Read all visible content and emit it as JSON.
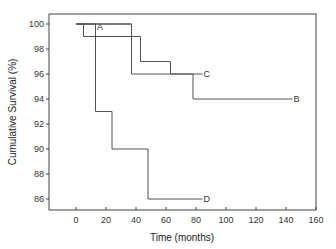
{
  "chart_data": {
    "type": "line",
    "subtype": "step (Kaplan-Meier)",
    "title": "",
    "xlabel": "Time (months)",
    "ylabel": "Cumulative Survival (%)",
    "xlim": [
      -15,
      160
    ],
    "ylim": [
      85.3,
      101.2
    ],
    "x_ticks": [
      0,
      20,
      40,
      60,
      80,
      100,
      120,
      140,
      160
    ],
    "y_ticks": [
      86,
      88,
      90,
      92,
      94,
      96,
      98,
      100
    ],
    "grid": false,
    "legend": "inline labels at curve ends",
    "series": [
      {
        "name": "A",
        "label_at": [
          12,
          100
        ],
        "steps": [
          [
            0,
            100
          ],
          [
            37,
            100
          ]
        ]
      },
      {
        "name": "B",
        "label_at": [
          145,
          94
        ],
        "steps": [
          [
            0,
            100
          ],
          [
            37,
            100
          ],
          [
            37,
            96
          ],
          [
            78,
            96
          ],
          [
            78,
            94
          ],
          [
            142,
            94
          ]
        ]
      },
      {
        "name": "C",
        "label_at": [
          85,
          96
        ],
        "steps": [
          [
            0,
            100
          ],
          [
            5,
            100
          ],
          [
            5,
            99
          ],
          [
            43,
            99
          ],
          [
            43,
            97
          ],
          [
            63,
            97
          ],
          [
            63,
            96
          ],
          [
            83,
            96
          ]
        ]
      },
      {
        "name": "D",
        "label_at": [
          85,
          86
        ],
        "steps": [
          [
            0,
            100
          ],
          [
            13,
            100
          ],
          [
            13,
            93
          ],
          [
            24,
            93
          ],
          [
            24,
            90
          ],
          [
            48,
            90
          ],
          [
            48,
            86
          ],
          [
            82,
            86
          ]
        ]
      }
    ]
  }
}
